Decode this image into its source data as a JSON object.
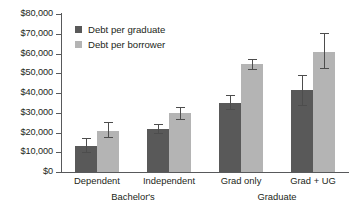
{
  "chart_data": {
    "type": "bar",
    "title": "",
    "subtitle": "",
    "xlabel": "",
    "ylabel": "",
    "ylim": [
      0,
      80000
    ],
    "ytick_step": 10000,
    "grid": false,
    "legend_position": "top-left",
    "y_tick_labels": [
      "$0",
      "$10,000",
      "$20,000",
      "$30,000",
      "$40,000",
      "$50,000",
      "$60,000",
      "$70,000",
      "$80,000"
    ],
    "y_tick_values": [
      0,
      10000,
      20000,
      30000,
      40000,
      50000,
      60000,
      70000,
      80000
    ],
    "categories": [
      "Dependent",
      "Independent",
      "Grad only",
      "Grad + UG"
    ],
    "group_labels": [
      "Bachelor's",
      "Graduate"
    ],
    "groups": [
      {
        "label": "Bachelor's",
        "categories": [
          "Dependent",
          "Independent"
        ]
      },
      {
        "label": "Graduate",
        "categories": [
          "Grad only",
          "Grad + UG"
        ]
      }
    ],
    "series": [
      {
        "name": "Debt per graduate",
        "color": "#595959",
        "values": [
          13000,
          22000,
          35000,
          41500
        ],
        "error_low": [
          10000,
          19500,
          32000,
          34000
        ],
        "error_high": [
          17000,
          24500,
          39000,
          49000
        ]
      },
      {
        "name": "Debt per borrower",
        "color": "#b4b4b4",
        "values": [
          21000,
          30000,
          54500,
          61000
        ],
        "error_low": [
          17500,
          27000,
          52000,
          52500
        ],
        "error_high": [
          25500,
          33000,
          57000,
          70500
        ]
      }
    ]
  },
  "legend": {
    "items": [
      {
        "label": "Debt per graduate",
        "color": "#595959"
      },
      {
        "label": "Debt per borrower",
        "color": "#b4b4b4"
      }
    ]
  },
  "colors": {
    "axis": "#58595b",
    "text": "#231f20",
    "background": "#ffffff",
    "series_dark": "#595959",
    "series_light": "#b4b4b4"
  }
}
